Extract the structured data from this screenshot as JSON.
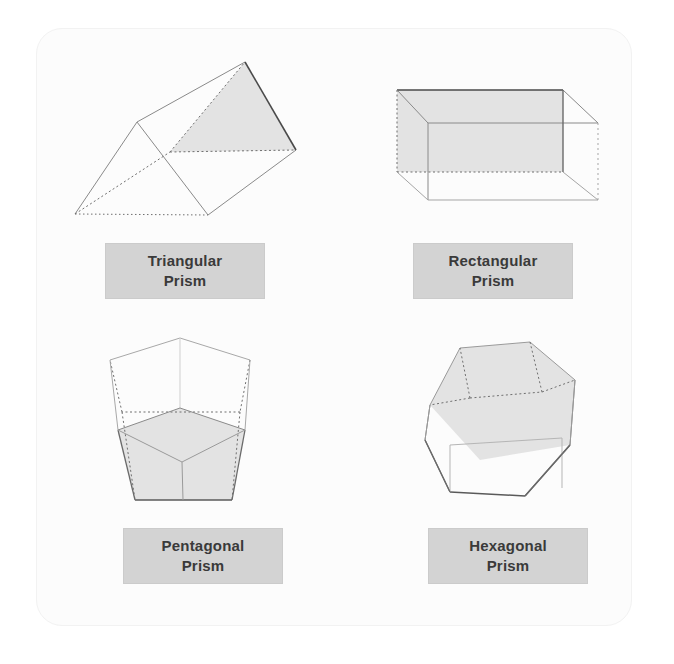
{
  "diagram": {
    "background_color": "#ffffff",
    "panel_color": "#fcfcfc",
    "panel_border_color": "#f2f2f2",
    "label_box_color": "#d3d3d3",
    "label_text_color": "#3a3a3a",
    "shaded_face_color": "#e3e3e3",
    "edge_color": "#8a8a8a",
    "hidden_edge_color": "#6f6f6f",
    "highlight_edge_color": "#555555"
  },
  "shapes": [
    {
      "id": "triangular-prism",
      "name": "Triangular Prism",
      "label_lines": [
        "Triangular",
        "Prism"
      ],
      "faces": 5,
      "edges": 9,
      "vertices": 6,
      "base_polygon": "triangle",
      "base_sides": 3,
      "label_box": {
        "x": 105,
        "y": 243,
        "width": 160,
        "height": 56
      }
    },
    {
      "id": "rectangular-prism",
      "name": "Rectangular Prism",
      "label_lines": [
        "Rectangular",
        "Prism"
      ],
      "faces": 6,
      "edges": 12,
      "vertices": 8,
      "base_polygon": "rectangle",
      "base_sides": 4,
      "label_box": {
        "x": 413,
        "y": 243,
        "width": 160,
        "height": 56
      }
    },
    {
      "id": "pentagonal-prism",
      "name": "Pentagonal Prism",
      "label_lines": [
        "Pentagonal",
        "Prism"
      ],
      "faces": 7,
      "edges": 15,
      "vertices": 10,
      "base_polygon": "pentagon",
      "base_sides": 5,
      "label_box": {
        "x": 123,
        "y": 528,
        "width": 160,
        "height": 56
      }
    },
    {
      "id": "hexagonal-prism",
      "name": "Hexagonal Prism",
      "label_lines": [
        "Hexagonal",
        "Prism"
      ],
      "faces": 8,
      "edges": 18,
      "vertices": 12,
      "base_polygon": "hexagon",
      "base_sides": 6,
      "label_box": {
        "x": 428,
        "y": 528,
        "width": 160,
        "height": 56
      }
    }
  ]
}
